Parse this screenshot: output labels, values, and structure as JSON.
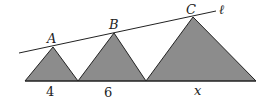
{
  "diagram": {
    "fill_color": "#8c8c8c",
    "stroke_color": "#222222",
    "line_label": "ℓ",
    "triangles": [
      {
        "apex_label": "A",
        "base_label": "4",
        "x0": 25,
        "x1": 78,
        "apex": [
          53,
          47
        ]
      },
      {
        "apex_label": "B",
        "base_label": "6",
        "x0": 78,
        "x1": 146,
        "apex": [
          114,
          33
        ]
      },
      {
        "apex_label": "C",
        "base_label": "x",
        "x0": 146,
        "x1": 256,
        "apex": [
          193,
          17
        ]
      }
    ],
    "baseline_y": 81,
    "line": {
      "x1": 19,
      "y1": 53,
      "x2": 216,
      "y2": 11
    }
  }
}
